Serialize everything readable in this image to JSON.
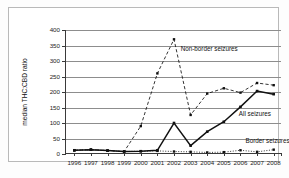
{
  "chart_data": {
    "type": "line",
    "title": "",
    "xlabel": "",
    "ylabel": "median THC:CBD ratio",
    "ylim": [
      0,
      400
    ],
    "yticks": [
      0,
      50,
      100,
      150,
      200,
      250,
      300,
      350,
      400
    ],
    "grid": true,
    "legend_position": "inline-annotations",
    "categories": [
      "1996",
      "1997",
      "1998",
      "1999",
      "2000",
      "2001",
      "2002",
      "2003",
      "2004",
      "2005",
      "2006",
      "2007",
      "2008"
    ],
    "series": [
      {
        "name": "Non-border seizures",
        "style": "dashed",
        "marker": "square",
        "values": [
          12,
          14,
          11,
          8,
          90,
          260,
          370,
          126,
          195,
          212,
          198,
          229,
          222
        ]
      },
      {
        "name": "All seizures",
        "style": "solid",
        "marker": "square",
        "values": [
          12,
          14,
          11,
          8,
          9,
          12,
          100,
          27,
          72,
          104,
          152,
          203,
          193
        ]
      },
      {
        "name": "Border seizures",
        "style": "dotted",
        "marker": "square",
        "values": [
          12,
          14,
          11,
          8,
          9,
          10,
          8,
          7,
          5,
          6,
          12,
          7,
          14
        ]
      }
    ],
    "annotations": [
      {
        "text": "Non-border seizures",
        "x": 2002.4,
        "y": 340
      },
      {
        "text": "All seizures",
        "x": 2005.9,
        "y": 128
      },
      {
        "text": "Border seizures",
        "x": 2006.3,
        "y": 42
      }
    ],
    "colors": {
      "ink": "#111111",
      "grid": "#8d8d8d",
      "axis": "#3a3a3a",
      "frame": "#b9b9b9",
      "background": "#ffffff"
    }
  }
}
